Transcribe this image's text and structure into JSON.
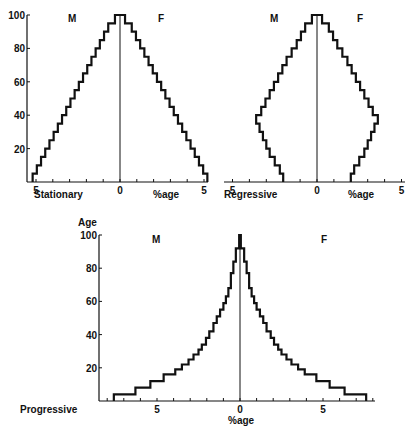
{
  "chart_data": [
    {
      "type": "bar",
      "subtype": "population-pyramid",
      "title": "Stationary",
      "xlabel": "%age",
      "ylabel": "",
      "left_label": "M",
      "right_label": "F",
      "ylim": [
        0,
        100
      ],
      "xlim": [
        -5,
        5
      ],
      "x_ticks": [
        "5",
        "0",
        "5"
      ],
      "y_ticks": [
        "20",
        "40",
        "60",
        "80",
        "100"
      ],
      "grid": false,
      "age_groups": [
        0,
        5,
        10,
        15,
        20,
        25,
        30,
        35,
        40,
        45,
        50,
        55,
        60,
        65,
        70,
        75,
        80,
        85,
        90,
        95
      ],
      "series": [
        {
          "name": "M",
          "values": [
            5.2,
            4.95,
            4.7,
            4.45,
            4.2,
            3.95,
            3.7,
            3.45,
            3.2,
            2.95,
            2.7,
            2.45,
            2.2,
            1.95,
            1.7,
            1.45,
            1.2,
            0.95,
            0.7,
            0.3
          ]
        },
        {
          "name": "F",
          "values": [
            5.2,
            4.95,
            4.7,
            4.45,
            4.2,
            3.95,
            3.7,
            3.45,
            3.2,
            2.95,
            2.7,
            2.45,
            2.2,
            1.95,
            1.7,
            1.45,
            1.2,
            0.95,
            0.7,
            0.3
          ]
        }
      ]
    },
    {
      "type": "bar",
      "subtype": "population-pyramid",
      "title": "Regressive",
      "xlabel": "%age",
      "ylabel": "",
      "left_label": "M",
      "right_label": "F",
      "ylim": [
        0,
        100
      ],
      "xlim": [
        -5,
        5
      ],
      "x_ticks": [
        "5",
        "0",
        "5"
      ],
      "y_ticks": [],
      "grid": false,
      "age_groups": [
        0,
        5,
        10,
        15,
        20,
        25,
        30,
        35,
        40,
        45,
        50,
        55,
        60,
        65,
        70,
        75,
        80,
        85,
        90,
        95
      ],
      "series": [
        {
          "name": "M",
          "values": [
            2.0,
            2.2,
            2.5,
            2.8,
            3.0,
            3.2,
            3.4,
            3.6,
            3.3,
            3.05,
            2.8,
            2.55,
            2.3,
            2.05,
            1.8,
            1.5,
            1.2,
            0.95,
            0.7,
            0.3
          ]
        },
        {
          "name": "F",
          "values": [
            2.0,
            2.2,
            2.5,
            2.8,
            3.0,
            3.2,
            3.4,
            3.6,
            3.3,
            3.05,
            2.8,
            2.55,
            2.3,
            2.05,
            1.8,
            1.5,
            1.2,
            0.95,
            0.7,
            0.3
          ]
        }
      ]
    },
    {
      "type": "bar",
      "subtype": "population-pyramid",
      "title": "Progressive",
      "xlabel": "%age",
      "ylabel": "Age",
      "left_label": "M",
      "right_label": "F",
      "ylim": [
        0,
        100
      ],
      "xlim": [
        -8,
        8
      ],
      "x_ticks": [
        "5",
        "0",
        "5"
      ],
      "y_ticks": [
        "20",
        "40",
        "60",
        "80",
        "100"
      ],
      "grid": false,
      "age_groups": [
        0,
        4,
        8,
        12,
        16,
        19,
        22,
        25,
        28,
        31,
        34,
        38,
        42,
        47,
        51,
        55,
        59,
        63,
        68,
        77,
        84,
        92,
        96
      ],
      "series": [
        {
          "name": "M",
          "values": [
            7.6,
            6.3,
            5.4,
            4.6,
            3.9,
            3.5,
            3.1,
            2.8,
            2.5,
            2.3,
            2.05,
            1.85,
            1.6,
            1.4,
            1.2,
            1.0,
            0.85,
            0.7,
            0.55,
            0.4,
            0.25,
            0.05,
            0.05
          ]
        },
        {
          "name": "F",
          "values": [
            7.6,
            6.3,
            5.4,
            4.6,
            3.9,
            3.5,
            3.1,
            2.8,
            2.5,
            2.3,
            2.05,
            1.85,
            1.6,
            1.4,
            1.2,
            1.0,
            0.85,
            0.7,
            0.55,
            0.4,
            0.25,
            0.05,
            0.05
          ]
        }
      ]
    }
  ]
}
